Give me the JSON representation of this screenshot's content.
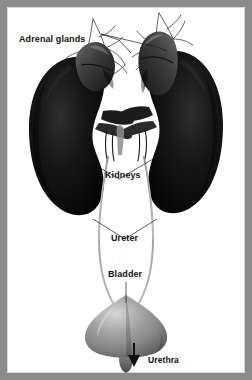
{
  "figure": {
    "kind": "anatomical-illustration",
    "style": "grayscale photographic render",
    "frame_color": "#8b8b8b",
    "panel_color": "#ffffff",
    "ink_color": "#111111"
  },
  "labels": {
    "adrenal_glands": "Adrenal glands",
    "kidneys": "Kidneys",
    "ureter": "Ureter",
    "bladder": "Bladder",
    "urethra": "Urethra"
  },
  "structures": [
    {
      "name": "left-adrenal-gland",
      "tone": "#4a4a4a"
    },
    {
      "name": "right-adrenal-gland",
      "tone": "#4a4a4a"
    },
    {
      "name": "left-kidney",
      "tone": "#111111"
    },
    {
      "name": "right-kidney",
      "tone": "#111111"
    },
    {
      "name": "renal-vessels",
      "tone": "#2a2a2a"
    },
    {
      "name": "left-ureter",
      "tone": "#7d7d7d"
    },
    {
      "name": "right-ureter",
      "tone": "#7d7d7d"
    },
    {
      "name": "bladder",
      "tone": "#9a9a9a"
    },
    {
      "name": "urethra",
      "tone": "#6f6f6f"
    }
  ],
  "leader_lines": [
    {
      "name": "adrenal-left-leader"
    },
    {
      "name": "adrenal-right-leader"
    },
    {
      "name": "kidneys-leader"
    },
    {
      "name": "ureter-leader"
    },
    {
      "name": "bladder-leader"
    },
    {
      "name": "urethra-arrow"
    }
  ]
}
